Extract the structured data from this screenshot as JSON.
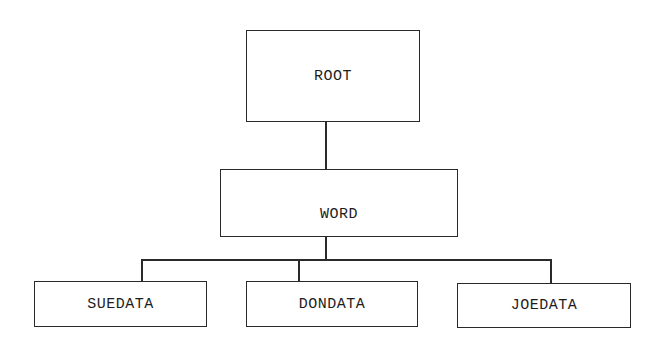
{
  "diagram": {
    "type": "hierarchy-tree",
    "nodes": {
      "root": {
        "label": "ROOT"
      },
      "word": {
        "label": "WORD"
      },
      "suedata": {
        "label": "SUEDATA"
      },
      "dondata": {
        "label": "DONDATA"
      },
      "joedata": {
        "label": "JOEDATA"
      }
    },
    "edges": [
      {
        "from": "ROOT",
        "to": "WORD"
      },
      {
        "from": "WORD",
        "to": "SUEDATA"
      },
      {
        "from": "WORD",
        "to": "DONDATA"
      },
      {
        "from": "WORD",
        "to": "JOEDATA"
      }
    ],
    "colors": {
      "line": "#2a2a2a",
      "text": "#1e1e1e",
      "background": "#ffffff"
    }
  }
}
